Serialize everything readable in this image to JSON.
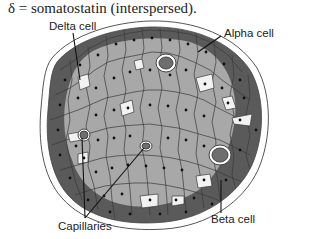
{
  "caption": "δ = somatostatin (interspersed).",
  "labels": {
    "delta": "Delta cell",
    "alpha": "Alpha cell",
    "beta": "Beta cell",
    "capillaries": "Capillaries"
  },
  "colors": {
    "alpha_cells": "#5a5a5a",
    "beta_cells": "#a8a8a8",
    "delta_cells": "#f2f2f2",
    "capillary": "#6e6e6e",
    "outline": "#444444",
    "nucleus": "#111111"
  }
}
